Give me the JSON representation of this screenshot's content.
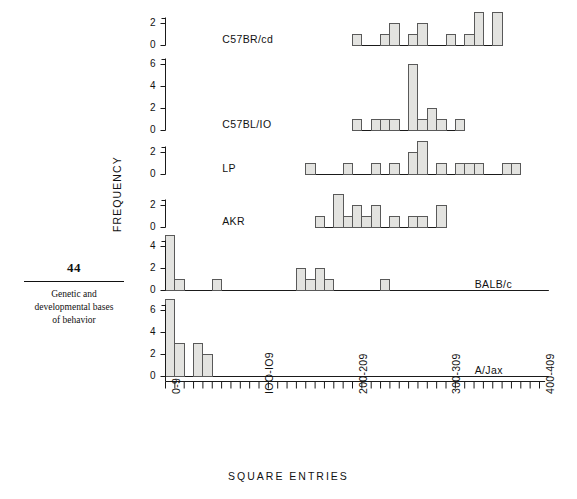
{
  "page": {
    "number": "44",
    "running_head_line1": "Genetic and",
    "running_head_line2": "developmental bases",
    "running_head_line3": "of behavior"
  },
  "chart_data": {
    "type": "bar",
    "title": "",
    "xlabel": "SQUARE  ENTRIES",
    "ylabel": "FREQUENCY",
    "bin_width": 10,
    "x_axis": {
      "min": 0,
      "max": 410,
      "tick_count": 41,
      "tick_interval": 10,
      "labeled_ticks": [
        {
          "index": 0,
          "label": "0-9"
        },
        {
          "index": 10,
          "label": "IOO-IO9"
        },
        {
          "index": 20,
          "label": "200-209"
        },
        {
          "index": 30,
          "label": "300-309"
        },
        {
          "index": 40,
          "label": "400-409"
        }
      ]
    },
    "panels": [
      {
        "name": "C57BR/cd",
        "label_x_bin": 2,
        "ylim": [
          0,
          3
        ],
        "yticks": [
          0,
          2
        ],
        "bins": [
          {
            "bin": 20,
            "value": 1
          },
          {
            "bin": 23,
            "value": 1
          },
          {
            "bin": 24,
            "value": 2
          },
          {
            "bin": 26,
            "value": 1
          },
          {
            "bin": 27,
            "value": 2
          },
          {
            "bin": 30,
            "value": 1
          },
          {
            "bin": 32,
            "value": 1
          },
          {
            "bin": 33,
            "value": 3
          },
          {
            "bin": 35,
            "value": 3
          }
        ]
      },
      {
        "name": "C57BL/IO",
        "label_x_bin": 2,
        "ylim": [
          0,
          6
        ],
        "yticks": [
          0,
          2,
          4,
          6
        ],
        "bins": [
          {
            "bin": 20,
            "value": 1
          },
          {
            "bin": 22,
            "value": 1
          },
          {
            "bin": 23,
            "value": 1
          },
          {
            "bin": 24,
            "value": 1
          },
          {
            "bin": 26,
            "value": 6
          },
          {
            "bin": 27,
            "value": 1
          },
          {
            "bin": 28,
            "value": 2
          },
          {
            "bin": 29,
            "value": 1
          },
          {
            "bin": 31,
            "value": 1
          }
        ]
      },
      {
        "name": "LP",
        "label_x_bin": 2,
        "ylim": [
          0,
          3
        ],
        "yticks": [
          0,
          2
        ],
        "bins": [
          {
            "bin": 15,
            "value": 1
          },
          {
            "bin": 19,
            "value": 1
          },
          {
            "bin": 22,
            "value": 1
          },
          {
            "bin": 24,
            "value": 1
          },
          {
            "bin": 26,
            "value": 2
          },
          {
            "bin": 27,
            "value": 3
          },
          {
            "bin": 29,
            "value": 1
          },
          {
            "bin": 31,
            "value": 1
          },
          {
            "bin": 32,
            "value": 1
          },
          {
            "bin": 33,
            "value": 1
          },
          {
            "bin": 36,
            "value": 1
          },
          {
            "bin": 37,
            "value": 1
          }
        ]
      },
      {
        "name": "AKR",
        "label_x_bin": 2,
        "ylim": [
          0,
          3
        ],
        "yticks": [
          0,
          2
        ],
        "bins": [
          {
            "bin": 16,
            "value": 1
          },
          {
            "bin": 18,
            "value": 3
          },
          {
            "bin": 19,
            "value": 1
          },
          {
            "bin": 20,
            "value": 2
          },
          {
            "bin": 21,
            "value": 1
          },
          {
            "bin": 22,
            "value": 2
          },
          {
            "bin": 24,
            "value": 1
          },
          {
            "bin": 26,
            "value": 1
          },
          {
            "bin": 27,
            "value": 1
          },
          {
            "bin": 29,
            "value": 2
          }
        ]
      },
      {
        "name": "BALB/c",
        "label_x_bin": 29,
        "ylim": [
          0,
          5
        ],
        "yticks": [
          0,
          2,
          4
        ],
        "bins": [
          {
            "bin": 0,
            "value": 5
          },
          {
            "bin": 1,
            "value": 1
          },
          {
            "bin": 5,
            "value": 1
          },
          {
            "bin": 14,
            "value": 2
          },
          {
            "bin": 15,
            "value": 1
          },
          {
            "bin": 16,
            "value": 2
          },
          {
            "bin": 17,
            "value": 1
          },
          {
            "bin": 23,
            "value": 1
          }
        ]
      },
      {
        "name": "A/Jax",
        "label_x_bin": 29,
        "ylim": [
          0,
          7
        ],
        "yticks": [
          0,
          2,
          4,
          6
        ],
        "bins": [
          {
            "bin": 0,
            "value": 7
          },
          {
            "bin": 1,
            "value": 3
          },
          {
            "bin": 3,
            "value": 3
          },
          {
            "bin": 4,
            "value": 2
          }
        ]
      }
    ],
    "colors": {
      "bar_fill": "#e3e3e0",
      "bar_stroke": "#595959",
      "axis": "#1a1a1a"
    }
  }
}
